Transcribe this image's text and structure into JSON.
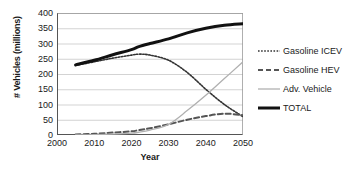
{
  "chart_data": {
    "type": "line",
    "title": "",
    "xlabel": "Year",
    "ylabel": "# Vehicles (millions)",
    "xlim": [
      2000,
      2050
    ],
    "ylim": [
      0,
      400
    ],
    "xticks": [
      2000,
      2010,
      2020,
      2030,
      2040,
      2050
    ],
    "yticks": [
      0,
      50,
      100,
      150,
      200,
      250,
      300,
      350,
      400
    ],
    "xtick_labels": [
      "2000",
      "2010",
      "2020",
      "2030",
      "2040",
      "2050"
    ],
    "ytick_labels": [
      "0",
      "50",
      "100",
      "150",
      "200",
      "250",
      "300",
      "350",
      "400"
    ],
    "grid": "horizontal",
    "legend_position": "right",
    "x": [
      2005,
      2010,
      2015,
      2020,
      2022,
      2025,
      2030,
      2035,
      2040,
      2045,
      2050
    ],
    "series": [
      {
        "name": "Gasoline ICEV",
        "style": "dotted",
        "color": "#333333",
        "width": 1.6,
        "values": [
          228,
          240,
          252,
          262,
          265,
          262,
          245,
          205,
          150,
          100,
          60
        ]
      },
      {
        "name": "Gasoline HEV",
        "style": "dashed",
        "color": "#555555",
        "width": 2.0,
        "values": [
          2,
          4,
          8,
          12,
          16,
          22,
          35,
          50,
          62,
          70,
          65
        ]
      },
      {
        "name": "Adv. Vehicle",
        "style": "solid",
        "color": "#b0b0b0",
        "width": 1.3,
        "values": [
          0,
          1,
          3,
          6,
          9,
          16,
          35,
          80,
          130,
          185,
          240
        ]
      },
      {
        "name": "TOTAL",
        "style": "solid",
        "color": "#111111",
        "width": 3.0,
        "values": [
          230,
          245,
          263,
          280,
          290,
          300,
          315,
          335,
          350,
          360,
          365
        ]
      }
    ]
  },
  "legend": {
    "items": [
      {
        "label": "Gasoline ICEV",
        "swatch": "dotted-line-swatch"
      },
      {
        "label": "Gasoline HEV",
        "swatch": "dashed-line-swatch"
      },
      {
        "label": "Adv. Vehicle",
        "swatch": "thin-solid-line-swatch"
      },
      {
        "label": "TOTAL",
        "swatch": "thick-solid-line-swatch"
      }
    ]
  }
}
